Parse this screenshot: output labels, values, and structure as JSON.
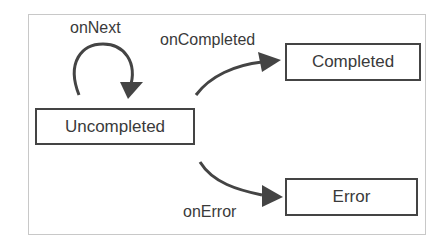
{
  "diagram": {
    "type": "state-diagram",
    "states": [
      {
        "id": "uncompleted",
        "label": "Uncompleted"
      },
      {
        "id": "completed",
        "label": "Completed"
      },
      {
        "id": "error",
        "label": "Error"
      }
    ],
    "transitions": [
      {
        "from": "uncompleted",
        "to": "uncompleted",
        "label": "onNext"
      },
      {
        "from": "uncompleted",
        "to": "completed",
        "label": "onCompleted"
      },
      {
        "from": "uncompleted",
        "to": "error",
        "label": "onError"
      }
    ],
    "colors": {
      "stroke": "#444444",
      "text": "#3a3a3a",
      "frame": "#c8c8c8",
      "background": "#ffffff"
    }
  }
}
